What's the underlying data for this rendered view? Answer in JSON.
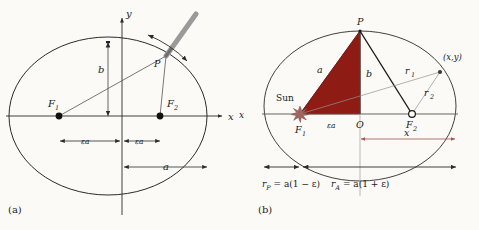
{
  "figure": {
    "background_color": "#fbfaf7",
    "stroke_color": "#2b2b2b",
    "accent_red": "#8e1b14",
    "sun_color": "#a0655f",
    "dim_red": "#a4514b",
    "pencil_color": "#9a9a9a"
  },
  "panel_a": {
    "label": "(a)",
    "axis_x_label": "x",
    "axis_y_label": "y",
    "focus_1_label": "F",
    "focus_1_sub": "1",
    "focus_2_label": "F",
    "focus_2_sub": "2",
    "point_p_label": "P",
    "semi_minor_label": "b",
    "semi_major_label": "a",
    "focal_left_label": "εa",
    "focal_right_label": "εa",
    "pencil_icon": "pencil-stylus-icon",
    "rotation_arrow_icon": "curved-double-arrow-icon"
  },
  "panel_b": {
    "label": "(b)",
    "sun_label": "Sun",
    "sun_icon": "sun-starburst-icon",
    "focus_1_label": "F",
    "focus_1_sub": "1",
    "focus_2_label": "F",
    "focus_2_sub": "2",
    "center_label": "O",
    "point_p_label": "P",
    "side_a_label": "a",
    "side_b_label": "b",
    "radius_1_label": "r",
    "radius_1_sub": "1",
    "radius_2_label": "r",
    "radius_2_sub": "2",
    "point_xy_label": "(x,y)",
    "focal_label": "εa",
    "x_dimension_label": "x",
    "perihelion_expr": "r",
    "perihelion_sub": "P",
    "perihelion_rhs": " = a(1 − ε)",
    "aphelion_expr": "r",
    "aphelion_sub": "A",
    "aphelion_rhs": " = a(1 + ε)",
    "edge_axis_label": "x"
  }
}
